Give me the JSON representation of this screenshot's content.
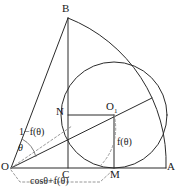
{
  "figure": {
    "kind": "geometry-diagram",
    "stroke_color": "#2b2b2b",
    "dashed_color": "#8d8d8d",
    "background": "#ffffff",
    "canvas": {
      "width": 177,
      "height": 191
    }
  },
  "points": {
    "O": {
      "label": "O",
      "x": 11,
      "y": 168
    },
    "A": {
      "label": "A",
      "x": 166,
      "y": 168
    },
    "B": {
      "label": "B",
      "x": 68,
      "y": 18
    },
    "C": {
      "label": "C",
      "x": 68,
      "y": 168
    },
    "M": {
      "label": "M",
      "x": 114,
      "y": 168
    },
    "N": {
      "label": "N",
      "x": 68,
      "y": 115
    },
    "O1": {
      "label": "O",
      "subscript": "1",
      "x": 114,
      "y": 115
    },
    "T": {
      "label": "",
      "x": 152,
      "y": 98
    }
  },
  "labels": {
    "vertex_o": "O",
    "vertex_a": "A",
    "vertex_b": "B",
    "vertex_c": "C",
    "vertex_m": "M",
    "vertex_n": "N",
    "vertex_o1": "O",
    "vertex_o1_subscript": "1",
    "angle_theta": "θ",
    "segment_o_to_o1": "1−f(θ)",
    "radius_label": "f(θ)",
    "base_label": "cosθ+f(θ)"
  },
  "circle": {
    "center_x": 114,
    "center_y": 115,
    "radius": 53,
    "tangent_point_base": "M",
    "tangent_point_arc": "T"
  },
  "sector": {
    "center": "O",
    "radius": 155,
    "arc_from": "B",
    "arc_to": "A"
  }
}
